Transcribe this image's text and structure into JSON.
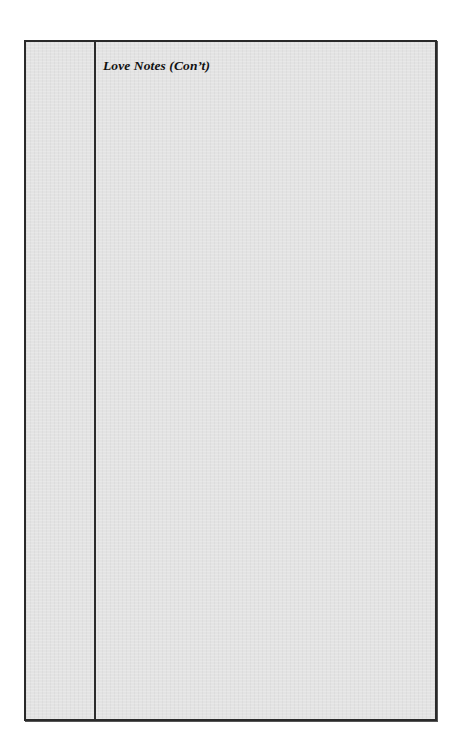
{
  "document": {
    "heading": "Love Notes (Con’t)",
    "layout": {
      "columns": [
        "margin",
        "content"
      ],
      "content_body": ""
    },
    "colors": {
      "paper": "#e3e3e3",
      "border": "#2a2a2a",
      "text": "#111111",
      "page_background": "#ffffff"
    }
  }
}
